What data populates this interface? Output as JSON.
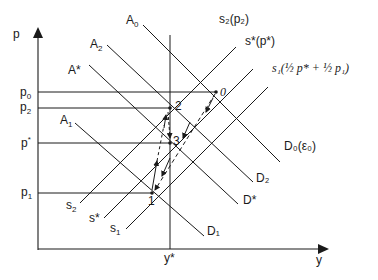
{
  "diagram": {
    "axes": {
      "y_axis_label": "p",
      "x_axis_label": "y",
      "x_tick_label": "y*"
    },
    "price_levels": [
      {
        "id": "p0",
        "base": "p",
        "sub": "0",
        "sup": ""
      },
      {
        "id": "p2",
        "base": "p",
        "sub": "2",
        "sup": ""
      },
      {
        "id": "pstar",
        "base": "p",
        "sub": "",
        "sup": "*"
      },
      {
        "id": "p1",
        "base": "p",
        "sub": "1",
        "sup": ""
      }
    ],
    "supply_curves": [
      {
        "id": "s2",
        "bottom_label": {
          "base": "s",
          "sub": "2"
        },
        "top_label": "s₂(p₂)"
      },
      {
        "id": "sstar",
        "bottom_label": {
          "base": "s*",
          "sub": ""
        },
        "top_label": "s*(p*)"
      },
      {
        "id": "s1",
        "bottom_label": {
          "base": "s",
          "sub": "1"
        },
        "top_label": "s₁(½ p* + ½ p₁)"
      }
    ],
    "demand_curves": [
      {
        "id": "A0",
        "top_label": {
          "base": "A",
          "sub": "0"
        },
        "bottom_label": "D₀(ε₀)"
      },
      {
        "id": "A2",
        "top_label": {
          "base": "A",
          "sub": "2"
        },
        "bottom_label": "D₂"
      },
      {
        "id": "Astar",
        "top_label": {
          "base": "A*",
          "sub": ""
        },
        "bottom_label": "D*"
      },
      {
        "id": "A1",
        "top_label": {
          "base": "A",
          "sub": "1"
        },
        "bottom_label": "D₁"
      }
    ],
    "points": [
      {
        "id": "0",
        "label": "0"
      },
      {
        "id": "1",
        "label": "1"
      },
      {
        "id": "2",
        "label": "2"
      },
      {
        "id": "3",
        "label": "3"
      }
    ],
    "colors": {
      "line": "#1a1a1a",
      "background": "#ffffff"
    }
  }
}
